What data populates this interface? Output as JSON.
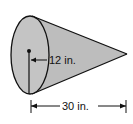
{
  "diagram": {
    "shape": "cone",
    "colors": {
      "fill": "#bdbdbd",
      "stroke": "#111111",
      "background": "#ffffff"
    },
    "labels": {
      "radius": "12 in.",
      "height": "30 in."
    }
  }
}
